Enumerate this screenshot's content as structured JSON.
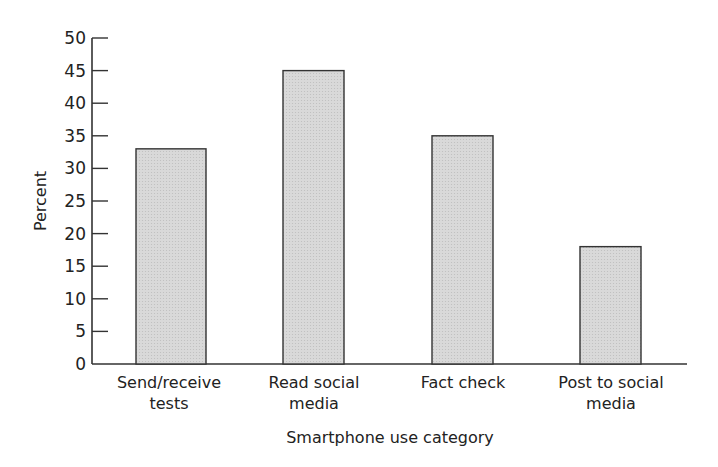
{
  "chart_data": {
    "type": "bar",
    "title": "",
    "xlabel": "Smartphone use category",
    "ylabel": "Percent",
    "categories": [
      [
        "Send/receive",
        "tests"
      ],
      [
        "Read social",
        "media"
      ],
      [
        "Fact check"
      ],
      [
        "Post to social",
        "media"
      ]
    ],
    "category_names": [
      "Send/receive tests",
      "Read social media",
      "Fact check",
      "Post to social media"
    ],
    "values": [
      33,
      45,
      35,
      18
    ],
    "ylim": [
      0,
      50
    ],
    "yticks": [
      0,
      5,
      10,
      15,
      20,
      25,
      30,
      35,
      40,
      45,
      50
    ],
    "grid": false,
    "legend": null,
    "colors": {
      "bar_fill": "#d4d4d4",
      "bar_stroke": "#333333",
      "axis": "#333333"
    }
  }
}
